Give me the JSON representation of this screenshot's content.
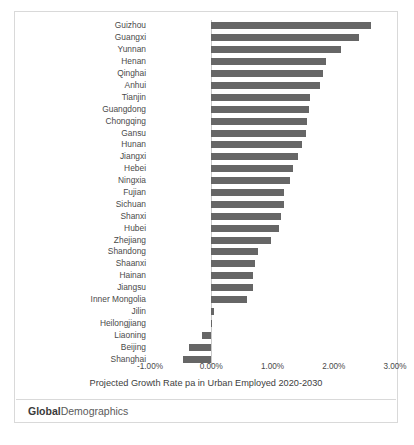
{
  "chart_data": {
    "type": "bar",
    "orientation": "horizontal",
    "title": "",
    "xlabel": "Projected Growth Rate pa in Urban Employed 2020-2030",
    "ylabel": "",
    "xlim": [
      -0.01,
      0.03
    ],
    "xticks": [
      "-1.00%",
      "0.00%",
      "1.00%",
      "2.00%",
      "3.00%"
    ],
    "xtick_values": [
      -0.01,
      0.0,
      0.01,
      0.02,
      0.03
    ],
    "grid": false,
    "legend": "none",
    "bar_color": "#666666",
    "categories": [
      "Guizhou",
      "Guangxi",
      "Yunnan",
      "Henan",
      "Qinghai",
      "Anhui",
      "Tianjin",
      "Guangdong",
      "Chongqing",
      "Gansu",
      "Hunan",
      "Jiangxi",
      "Hebei",
      "Ningxia",
      "Fujian",
      "Sichuan",
      "Shanxi",
      "Hubei",
      "Zhejiang",
      "Shandong",
      "Shaanxi",
      "Hainan",
      "Jiangsu",
      "Inner Mongolia",
      "Jilin",
      "Heilongjiang",
      "Liaoning",
      "Beijing",
      "Shanghai"
    ],
    "values": [
      0.0261,
      0.0241,
      0.0212,
      0.0188,
      0.0182,
      0.0177,
      0.0162,
      0.0159,
      0.0156,
      0.0154,
      0.0148,
      0.0141,
      0.0133,
      0.0129,
      0.0118,
      0.0118,
      0.0114,
      0.011,
      0.0098,
      0.0076,
      0.0072,
      0.0068,
      0.0068,
      0.0059,
      0.0004,
      0.0,
      -0.0015,
      -0.0036,
      -0.0046
    ]
  },
  "footer": {
    "brand_strong": "Global",
    "brand_light": "Demographics"
  }
}
